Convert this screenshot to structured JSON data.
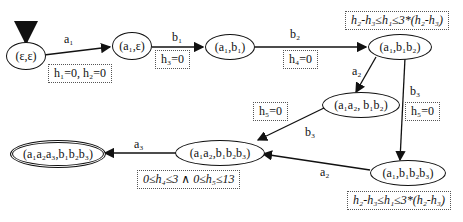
{
  "nodes": {
    "n0": {
      "label": "(ε,ε)"
    },
    "n1": {
      "label": "(a₁,ε)"
    },
    "n2": {
      "label": "(a₁,b₁)"
    },
    "n3": {
      "label": "(a₁,b₁b₂)"
    },
    "n4": {
      "label": "(a₁a₂, b₁b₂)"
    },
    "n5": {
      "label": "(a₁,b₁b₂b₃)"
    },
    "n6": {
      "label": "(a₁a₂,b₁b₂b₃)"
    },
    "n7": {
      "label": "(a₁a₂a₃,b₁b₂b₃)"
    }
  },
  "edges": {
    "e1": "a₁",
    "e2": "b₁",
    "e3": "b₂",
    "e4": "a₂",
    "e5": "b₃",
    "e6": "b₃",
    "e7": "a₂",
    "e8": "a₃"
  },
  "constraints": {
    "c1": "h₁=0, h₂=0",
    "c2": "h₃=0",
    "c3": "h₄=0",
    "c4": "h₂-h₃≤h₁≤3*(h₂-h₃)",
    "c5": "h₅=0",
    "c6": "h₅=0",
    "c7": "0≤h₄≤3 ∧ 0≤h₅≤13",
    "c8": "h₂-h₃≤h₁≤3*(h₂-h₃)"
  }
}
